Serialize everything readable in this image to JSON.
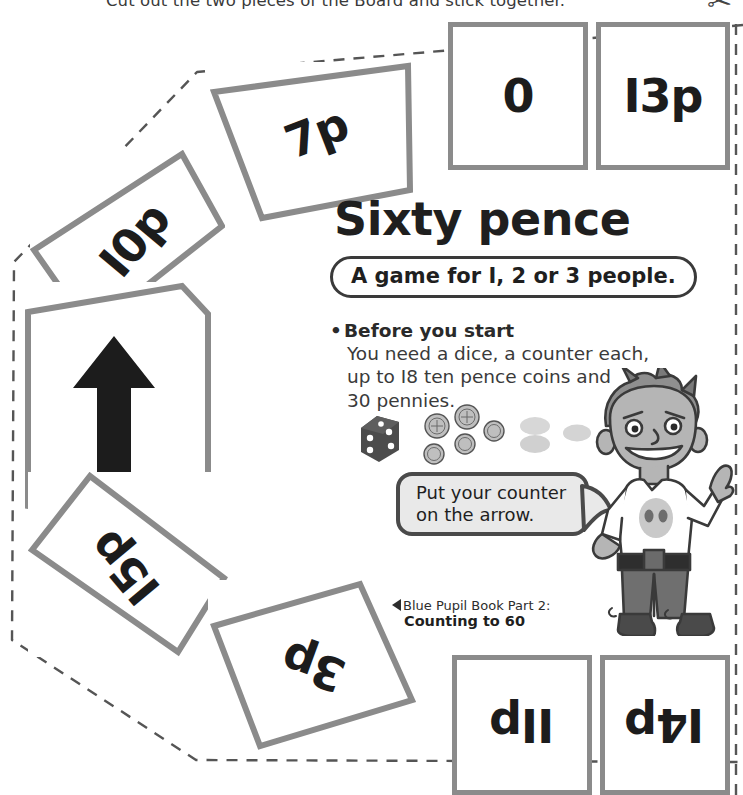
{
  "worksheet": {
    "top_instruction": "Cut out the two pieces of the Board and stick together.",
    "cut_mark_icon": "scissors-icon"
  },
  "panel": {
    "title": "Sixty pence",
    "players_pill": "A game for I, 2 or 3 people.",
    "section_heading": "Before you start",
    "bullet_char": "•",
    "body_line_1": "You need a dice, a counter each,",
    "body_line_2": "up to I8 ten pence coins and",
    "body_line_3": "30 pennies."
  },
  "speech_bubble": {
    "line_1": "Put your counter",
    "line_2": "on the arrow."
  },
  "credit": {
    "triangle_icon": "left-triangle-icon",
    "line_1": "Blue Pupil Book Part 2:",
    "line_2": "Counting to 60"
  },
  "props": {
    "dice_icon": "dice-icon",
    "coin_icon": "ten-pence-coin-icon",
    "counter_icon": "game-counter-icon",
    "coin_count": 6,
    "counter_count": 3
  },
  "character": {
    "name": "cartoon-boy-character",
    "gesture": "pointing-up-finger",
    "shirt_motif": "alien-face-icon"
  },
  "board": {
    "cells": [
      {
        "id": "cell-7p",
        "label": "7p",
        "type": "value"
      },
      {
        "id": "cell-0",
        "label": "0",
        "type": "value"
      },
      {
        "id": "cell-13p",
        "label": "I3p",
        "type": "value"
      },
      {
        "id": "cell-10p",
        "label": "I0p",
        "type": "value"
      },
      {
        "id": "cell-arrow",
        "label": "",
        "type": "arrow",
        "icon": "up-arrow-icon"
      },
      {
        "id": "cell-15p",
        "label": "I5p",
        "type": "value"
      },
      {
        "id": "cell-3p",
        "label": "3p",
        "type": "value"
      },
      {
        "id": "cell-11p",
        "label": "IIp",
        "type": "value"
      },
      {
        "id": "cell-4p",
        "label": "I4p",
        "type": "value"
      }
    ]
  },
  "colors": {
    "cell_border": "#8b8b8b",
    "text_dark": "#1c1c1c",
    "body_text": "#3a3a3a",
    "bubble_fill": "#e9e9e9",
    "bubble_border": "#4a4a4a",
    "dash_line": "#555555"
  }
}
